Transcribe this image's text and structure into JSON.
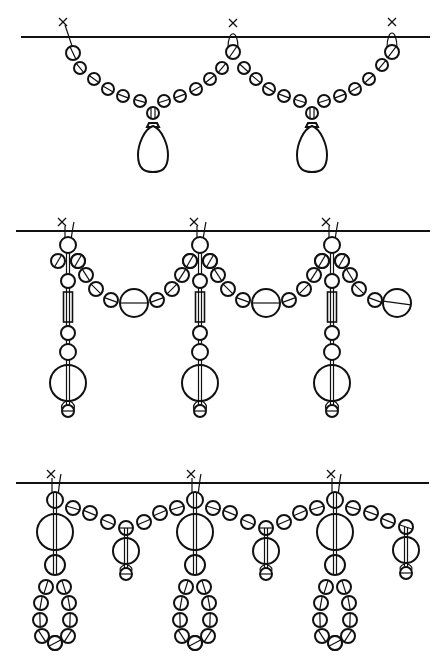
{
  "diagram": {
    "type": "beading-pattern",
    "colors": {
      "stroke": "#111111",
      "background": "#ffffff"
    },
    "patterns": [
      {
        "id": "pattern-1-teardrop-swags",
        "baseline": {
          "x1": 21,
          "x2": 430,
          "y": 37
        },
        "anchors": [
          {
            "x": 63,
            "y": 22
          },
          {
            "x": 233,
            "y": 23
          },
          {
            "x": 392,
            "y": 22
          }
        ],
        "swag_beads": [
          [
            73,
            53,
            7
          ],
          [
            80,
            68,
            6
          ],
          [
            94,
            79,
            6
          ],
          [
            108,
            89,
            6
          ],
          [
            123,
            96,
            6
          ],
          [
            140,
            101,
            6
          ],
          [
            164,
            101,
            6
          ],
          [
            180,
            96,
            6
          ],
          [
            196,
            89,
            6
          ],
          [
            210,
            79,
            6
          ],
          [
            222,
            68,
            6
          ],
          [
            233,
            52,
            7
          ],
          [
            244,
            68,
            6
          ],
          [
            256,
            79,
            6
          ],
          [
            269,
            89,
            6
          ],
          [
            284,
            96,
            6
          ],
          [
            300,
            101,
            6
          ],
          [
            324,
            101,
            6
          ],
          [
            340,
            96,
            6
          ],
          [
            355,
            89,
            6
          ],
          [
            369,
            79,
            6
          ],
          [
            382,
            65,
            6
          ],
          [
            392,
            52,
            7
          ]
        ],
        "pendants": [
          {
            "bead": [
              153,
              113,
              6
            ],
            "drop": {
              "cx": 153,
              "top": 123,
              "bottom": 172,
              "w": 30
            }
          },
          {
            "bead": [
              312,
              113,
              6
            ],
            "drop": {
              "cx": 312,
              "top": 123,
              "bottom": 172,
              "w": 30
            }
          }
        ]
      },
      {
        "id": "pattern-2-columns-with-swags",
        "baseline": {
          "x1": 16,
          "x2": 430,
          "y": 231
        },
        "columns_x": [
          68,
          200,
          332
        ],
        "column": {
          "top_bead": [
            0,
            245,
            8
          ],
          "side_beads": [
            [
              -10,
              261,
              7
            ],
            [
              10,
              261,
              7
            ]
          ],
          "bead_a": [
            0,
            281,
            7
          ],
          "tube": {
            "top": 292,
            "bottom": 322,
            "w": 9
          },
          "bead_b": [
            0,
            333,
            7
          ],
          "bead_c": [
            0,
            352,
            8
          ],
          "big_bead": [
            0,
            383,
            18
          ],
          "end_bead": [
            0,
            411,
            6
          ]
        },
        "swags": [
          {
            "beads": [
              [
                78,
                261,
                7
              ],
              [
                86,
                275,
                7
              ],
              [
                96,
                289,
                7
              ],
              [
                111,
                300,
                7
              ],
              [
                134,
                303,
                14
              ],
              [
                157,
                300,
                7
              ],
              [
                172,
                289,
                7
              ],
              [
                182,
                275,
                7
              ],
              [
                190,
                261,
                7
              ]
            ]
          },
          {
            "beads": [
              [
                210,
                261,
                7
              ],
              [
                218,
                275,
                7
              ],
              [
                228,
                289,
                7
              ],
              [
                243,
                300,
                7
              ],
              [
                266,
                303,
                14
              ],
              [
                289,
                300,
                7
              ],
              [
                304,
                289,
                7
              ],
              [
                314,
                275,
                7
              ],
              [
                322,
                261,
                7
              ]
            ]
          },
          {
            "beads": [
              [
                342,
                261,
                7
              ],
              [
                350,
                275,
                7
              ],
              [
                359,
                289,
                7
              ],
              [
                375,
                300,
                7
              ],
              [
                397,
                303,
                14
              ]
            ],
            "tail_to_x": 412
          }
        ]
      },
      {
        "id": "pattern-3-loops-and-pendants",
        "baseline": {
          "x1": 16,
          "x2": 429,
          "y": 483
        },
        "columns_x": [
          55,
          195,
          335
        ],
        "column": {
          "top_bead": [
            0,
            500,
            8
          ],
          "big_bead": [
            0,
            532,
            18
          ],
          "mid_bead": [
            0,
            565,
            10
          ],
          "loop_beads": [
            [
              -9,
              587,
              7
            ],
            [
              9,
              587,
              7
            ],
            [
              -14,
              603,
              7
            ],
            [
              14,
              603,
              7
            ],
            [
              -15,
              620,
              7
            ],
            [
              15,
              620,
              7
            ],
            [
              -13,
              636,
              7
            ],
            [
              13,
              636,
              7
            ],
            [
              0,
              643,
              7
            ]
          ]
        },
        "swags": [
          {
            "beads": [
              [
                73,
                508,
                7
              ],
              [
                90,
                513,
                7
              ],
              [
                108,
                522,
                7
              ],
              [
                126,
                528,
                7
              ],
              [
                144,
                522,
                7
              ],
              [
                160,
                513,
                7
              ],
              [
                177,
                508,
                7
              ]
            ],
            "pendant_x": 126
          },
          {
            "beads": [
              [
                213,
                508,
                7
              ],
              [
                230,
                513,
                7
              ],
              [
                248,
                522,
                7
              ],
              [
                266,
                528,
                7
              ],
              [
                284,
                522,
                7
              ],
              [
                300,
                513,
                7
              ],
              [
                317,
                508,
                7
              ]
            ],
            "pendant_x": 266
          },
          {
            "beads": [
              [
                353,
                508,
                7
              ],
              [
                371,
                513,
                7
              ],
              [
                388,
                521,
                7
              ],
              [
                406,
                527,
                7
              ]
            ],
            "pendant_x": 406
          }
        ],
        "pendant": {
          "big_bead_dy": 23,
          "big_r": 13,
          "small_dy": 46,
          "small_r": 6
        }
      }
    ]
  }
}
